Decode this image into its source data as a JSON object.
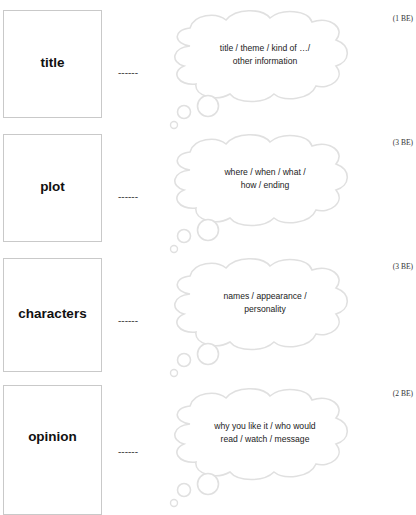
{
  "sections": [
    {
      "label": "title",
      "dashes": "------",
      "hint_line1": "title / theme / kind of …/",
      "hint_line2": "other information",
      "points": "(1 BE)"
    },
    {
      "label": "plot",
      "dashes": "------",
      "hint_line1": "where / when / what /",
      "hint_line2": "how / ending",
      "points": "(3 BE)"
    },
    {
      "label": "characters",
      "dashes": "------",
      "hint_line1": "names / appearance /",
      "hint_line2": "personality",
      "points": "(3 BE)"
    },
    {
      "label": "opinion",
      "dashes": "------",
      "hint_line1": "why you like it / who would",
      "hint_line2": "read / watch / message",
      "points": "(2 BE)"
    }
  ],
  "colors": {
    "box_border": "#c9c9c9",
    "cloud_stroke": "#e2e2e2",
    "text": "#222222"
  }
}
